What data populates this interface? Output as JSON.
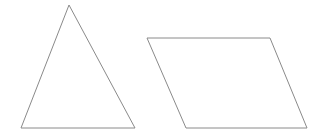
{
  "diagram": {
    "background": "#ffffff",
    "stroke_color": "#8a8a8a",
    "shapes": [
      {
        "type": "triangle",
        "points": [
          [
            69,
            5
          ],
          [
            21,
            128
          ],
          [
            135,
            128
          ]
        ]
      },
      {
        "type": "parallelogram",
        "points": [
          [
            147,
            38
          ],
          [
            270,
            38
          ],
          [
            307,
            128
          ],
          [
            186,
            128
          ]
        ]
      }
    ]
  }
}
